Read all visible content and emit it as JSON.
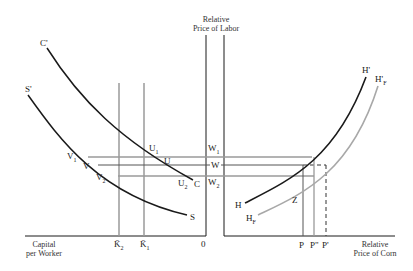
{
  "diagram": {
    "left_panel": {
      "x_axis_label_line1": "Capital",
      "x_axis_label_line2": "per Worker",
      "origin_label": "0",
      "k_lines": [
        {
          "label": "K̄",
          "sub": "2"
        },
        {
          "label": "K̄",
          "sub": "1"
        }
      ],
      "curves": {
        "C": {
          "top": "C'",
          "bottom": "C"
        },
        "S": {
          "top": "S'",
          "bottom": "S"
        }
      },
      "points": {
        "U1": {
          "label": "U",
          "sub": "1"
        },
        "U": {
          "label": "U"
        },
        "U2": {
          "label": "U",
          "sub": "2"
        },
        "V1": {
          "label": "V",
          "sub": "1"
        },
        "V": {
          "label": "V"
        },
        "V2": {
          "label": "V",
          "sub": "2"
        }
      }
    },
    "center_axis": {
      "title_line1": "Relative",
      "title_line2": "Price of Labor",
      "wages": [
        {
          "label": "W",
          "sub": "1"
        },
        {
          "label": "W"
        },
        {
          "label": "W",
          "sub": "2"
        }
      ]
    },
    "right_panel": {
      "x_axis_label_line1": "Relative",
      "x_axis_label_line2": "Price of Corn",
      "prices": [
        {
          "label": "P"
        },
        {
          "label": "P\""
        },
        {
          "label": "P'"
        }
      ],
      "curves": {
        "H": {
          "top": "H'",
          "bottom": "H"
        },
        "HF": {
          "top_label": "H'",
          "top_sub": "F",
          "bottom_label": "H",
          "bottom_sub": "F"
        }
      },
      "point_z": "Z"
    },
    "colors": {
      "ink": "#1a1a1a",
      "gray_line": "#9a9a9a",
      "light_curve": "#a8a8a8"
    }
  }
}
